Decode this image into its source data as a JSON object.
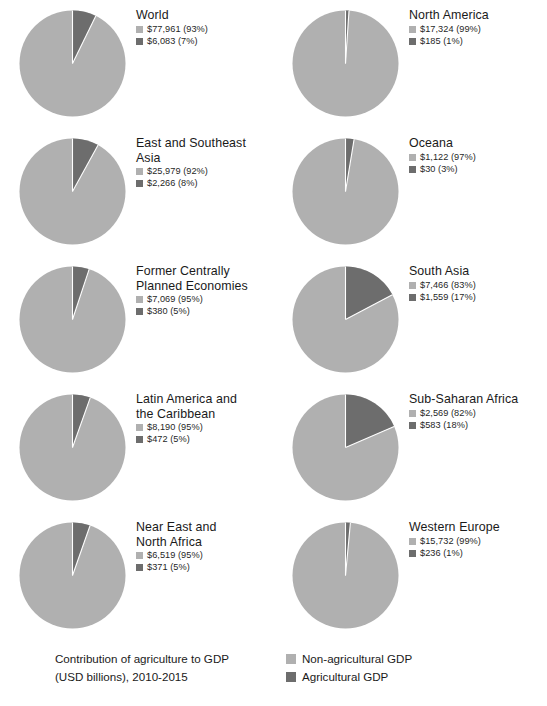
{
  "colors": {
    "non_agricultural": "#b0b0b0",
    "agricultural": "#6d6d6d",
    "slice_gap": "#ffffff",
    "text": "#1a1a1a"
  },
  "footer": {
    "caption_line1": "Contribution of agriculture to GDP",
    "caption_line2": "(USD billions), 2010-2015",
    "legend": [
      {
        "label": "Non-agricultural GDP",
        "color": "#b0b0b0"
      },
      {
        "label": "Agricultural GDP",
        "color": "#6d6d6d"
      }
    ]
  },
  "chart_data": {
    "type": "pie",
    "title": "Contribution of agriculture to GDP (USD billions), 2010-2015",
    "units": "USD billions",
    "period": "2010-2015",
    "legend_position": "bottom-right",
    "series_names": [
      "Non-agricultural GDP",
      "Agricultural GDP"
    ],
    "charts": [
      {
        "region": "World",
        "title_lines": "World",
        "slices": [
          {
            "name": "Non-agricultural GDP",
            "value": 77961,
            "percent": 93,
            "label": "$77,961 (93%)",
            "color": "#b0b0b0"
          },
          {
            "name": "Agricultural GDP",
            "value": 6083,
            "percent": 7,
            "label": "$6,083 (7%)",
            "color": "#6d6d6d"
          }
        ]
      },
      {
        "region": "North America",
        "title_lines": "North America",
        "slices": [
          {
            "name": "Non-agricultural GDP",
            "value": 17324,
            "percent": 99,
            "label": "$17,324 (99%)",
            "color": "#b0b0b0"
          },
          {
            "name": "Agricultural GDP",
            "value": 185,
            "percent": 1,
            "label": "$185 (1%)",
            "color": "#6d6d6d"
          }
        ]
      },
      {
        "region": "East and Southeast Asia",
        "title_lines": "East and Southeast\nAsia",
        "slices": [
          {
            "name": "Non-agricultural GDP",
            "value": 25979,
            "percent": 92,
            "label": "$25,979 (92%)",
            "color": "#b0b0b0"
          },
          {
            "name": "Agricultural GDP",
            "value": 2266,
            "percent": 8,
            "label": "$2,266 (8%)",
            "color": "#6d6d6d"
          }
        ]
      },
      {
        "region": "Oceana",
        "title_lines": "Oceana",
        "slices": [
          {
            "name": "Non-agricultural GDP",
            "value": 1122,
            "percent": 97,
            "label": "$1,122 (97%)",
            "color": "#b0b0b0"
          },
          {
            "name": "Agricultural GDP",
            "value": 30,
            "percent": 3,
            "label": "$30 (3%)",
            "color": "#6d6d6d"
          }
        ]
      },
      {
        "region": "Former Centrally Planned Economies",
        "title_lines": "Former Centrally\nPlanned Economies",
        "slices": [
          {
            "name": "Non-agricultural GDP",
            "value": 7069,
            "percent": 95,
            "label": "$7,069 (95%)",
            "color": "#b0b0b0"
          },
          {
            "name": "Agricultural GDP",
            "value": 380,
            "percent": 5,
            "label": "$380 (5%)",
            "color": "#6d6d6d"
          }
        ]
      },
      {
        "region": "South Asia",
        "title_lines": "South Asia",
        "slices": [
          {
            "name": "Non-agricultural GDP",
            "value": 7466,
            "percent": 83,
            "label": "$7,466 (83%)",
            "color": "#b0b0b0"
          },
          {
            "name": "Agricultural GDP",
            "value": 1559,
            "percent": 17,
            "label": "$1,559 (17%)",
            "color": "#6d6d6d"
          }
        ]
      },
      {
        "region": "Latin America and the Caribbean",
        "title_lines": "Latin America and\nthe Caribbean",
        "slices": [
          {
            "name": "Non-agricultural GDP",
            "value": 8190,
            "percent": 95,
            "label": "$8,190 (95%)",
            "color": "#b0b0b0"
          },
          {
            "name": "Agricultural GDP",
            "value": 472,
            "percent": 5,
            "label": "$472 (5%)",
            "color": "#6d6d6d"
          }
        ]
      },
      {
        "region": "Sub-Saharan Africa",
        "title_lines": "Sub-Saharan Africa",
        "slices": [
          {
            "name": "Non-agricultural GDP",
            "value": 2569,
            "percent": 82,
            "label": "$2,569 (82%)",
            "color": "#b0b0b0"
          },
          {
            "name": "Agricultural GDP",
            "value": 583,
            "percent": 18,
            "label": "$583 (18%)",
            "color": "#6d6d6d"
          }
        ]
      },
      {
        "region": "Near East and North Africa",
        "title_lines": "Near East and\nNorth Africa",
        "slices": [
          {
            "name": "Non-agricultural GDP",
            "value": 6519,
            "percent": 95,
            "label": "$6,519 (95%)",
            "color": "#b0b0b0"
          },
          {
            "name": "Agricultural GDP",
            "value": 371,
            "percent": 5,
            "label": "$371 (5%)",
            "color": "#6d6d6d"
          }
        ]
      },
      {
        "region": "Western Europe",
        "title_lines": "Western Europe",
        "slices": [
          {
            "name": "Non-agricultural GDP",
            "value": 15732,
            "percent": 99,
            "label": "$15,732 (99%)",
            "color": "#b0b0b0"
          },
          {
            "name": "Agricultural GDP",
            "value": 236,
            "percent": 1,
            "label": "$236 (1%)",
            "color": "#6d6d6d"
          }
        ]
      }
    ]
  }
}
